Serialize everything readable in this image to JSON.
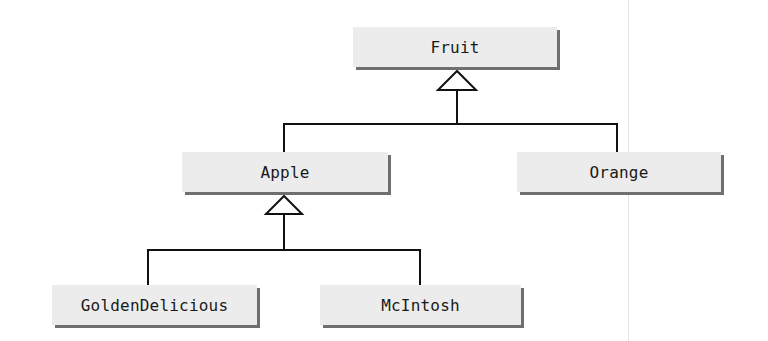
{
  "diagram": {
    "type": "uml-class-inheritance",
    "colors": {
      "box_fill": "#ececec",
      "box_shadow": "#6f6f6f",
      "line": "#111111",
      "text": "#1a1a1a"
    },
    "classes": [
      {
        "id": "fruit",
        "name": "Fruit",
        "parent": null
      },
      {
        "id": "apple",
        "name": "Apple",
        "parent": "Fruit"
      },
      {
        "id": "orange",
        "name": "Orange",
        "parent": "Fruit"
      },
      {
        "id": "golden-delicious",
        "name": "GoldenDelicious",
        "parent": "Apple"
      },
      {
        "id": "mcintosh",
        "name": "McIntosh",
        "parent": "Apple"
      }
    ],
    "relationships": [
      {
        "from": "Apple",
        "to": "Fruit",
        "kind": "generalization"
      },
      {
        "from": "Orange",
        "to": "Fruit",
        "kind": "generalization"
      },
      {
        "from": "GoldenDelicious",
        "to": "Apple",
        "kind": "generalization"
      },
      {
        "from": "McIntosh",
        "to": "Apple",
        "kind": "generalization"
      }
    ]
  }
}
